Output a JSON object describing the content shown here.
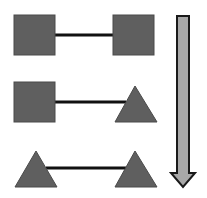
{
  "diagram": {
    "colors": {
      "shape_fill": "#5f5f5f",
      "shape_stroke": "#4a4a4a",
      "connector": "#111111",
      "arrow_fill": "#a8a8a8",
      "arrow_stroke": "#1a1a1a",
      "background": "#ffffff"
    },
    "rows": [
      {
        "left": "square",
        "right": "square"
      },
      {
        "left": "square",
        "right": "triangle"
      },
      {
        "left": "triangle",
        "right": "triangle"
      }
    ],
    "arrow": {
      "direction": "down"
    }
  }
}
